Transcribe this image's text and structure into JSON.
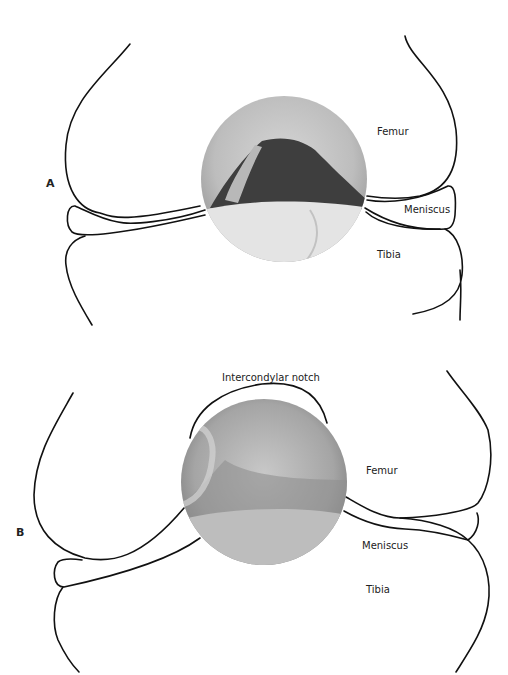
{
  "panels": [
    {
      "id": "A",
      "label": "A",
      "annotations": {
        "femur": "Femur",
        "meniscus": "Meniscus",
        "tibia": "Tibia"
      },
      "scope_view": {
        "cx": 284,
        "cy": 179,
        "r": 83
      }
    },
    {
      "id": "B",
      "label": "B",
      "annotations": {
        "notch": "Intercondylar notch",
        "femur": "Femur",
        "meniscus": "Meniscus",
        "tibia": "Tibia"
      },
      "scope_view": {
        "cx": 264,
        "cy": 482,
        "r": 83
      }
    }
  ],
  "colors": {
    "line": "#111111",
    "background": "#ffffff",
    "scope_light": "#d8d8d8",
    "scope_mid": "#a8a8a8",
    "scope_dark": "#3a3a3a"
  }
}
